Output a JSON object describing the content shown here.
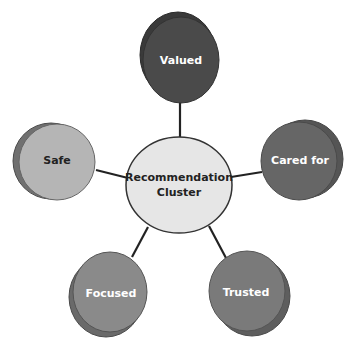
{
  "diagram": {
    "center": {
      "label_line1": "Recommendation",
      "label_line2": "Cluster",
      "fill": "#e6e6e6",
      "text_color": "#222222"
    },
    "nodes": [
      {
        "label": "Valued",
        "fill": "#4a4a4a",
        "shadow": "#3a3a3a",
        "text_color": "#ffffff"
      },
      {
        "label": "Cared for",
        "fill": "#666666",
        "shadow": "#555555",
        "text_color": "#ffffff"
      },
      {
        "label": "Trusted",
        "fill": "#7a7a7a",
        "shadow": "#5e5e5e",
        "text_color": "#ffffff"
      },
      {
        "label": "Focused",
        "fill": "#8a8a8a",
        "shadow": "#6a6a6a",
        "text_color": "#ffffff"
      },
      {
        "label": "Safe",
        "fill": "#b5b5b5",
        "shadow": "#707070",
        "text_color": "#222222"
      }
    ]
  }
}
